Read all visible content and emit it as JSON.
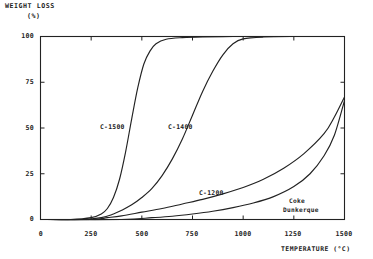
{
  "figure": {
    "background": "#ffffff",
    "ink": "#222222"
  },
  "axes": {
    "y_title_line1": "WEIGHT LOSS",
    "y_title_line2": "(%)",
    "x_title": "TEMPERATURE (°C)"
  },
  "chart_data": {
    "type": "line",
    "title": "",
    "subtitle": "",
    "xlabel": "TEMPERATURE (°C)",
    "ylabel": "WEIGHT LOSS (%)",
    "xlim": [
      0,
      1500
    ],
    "ylim": [
      0,
      100
    ],
    "xticks": [
      0,
      250,
      500,
      750,
      1000,
      1250,
      1500
    ],
    "yticks": [
      0,
      25,
      50,
      75,
      100
    ],
    "xtick_labels": [
      "0",
      "250",
      "500",
      "750",
      "1000",
      "1250",
      "1500"
    ],
    "ytick_labels": [
      "0",
      "25",
      "50",
      "75",
      "100"
    ],
    "grid": false,
    "legend": "inline-annotations",
    "line_color": "#222222",
    "series": [
      {
        "name": "C-1500",
        "label": "C-1500",
        "label_x": 420,
        "label_y": 53,
        "x": [
          0,
          150,
          250,
          300,
          330,
          360,
          390,
          420,
          450,
          480,
          510,
          540,
          570,
          620,
          700,
          800,
          950,
          1100,
          1250,
          1400,
          1500
        ],
        "y": [
          0,
          0,
          1,
          3,
          6,
          12,
          22,
          37,
          55,
          72,
          85,
          92,
          96,
          98.5,
          99.4,
          99.8,
          100,
          100,
          100,
          100,
          100
        ]
      },
      {
        "name": "C-1400",
        "label": "C-1400",
        "label_x": 700,
        "label_y": 53,
        "x": [
          0,
          200,
          300,
          360,
          400,
          450,
          500,
          550,
          600,
          650,
          700,
          750,
          800,
          850,
          900,
          950,
          1000,
          1100,
          1250,
          1400,
          1500
        ],
        "y": [
          0,
          0,
          1,
          3,
          5,
          8,
          12,
          17,
          24,
          33,
          44,
          57,
          70,
          81,
          90,
          96,
          98.7,
          99.7,
          100,
          100,
          100
        ]
      },
      {
        "name": "C-1200",
        "label": "C-1200",
        "label_x": 800,
        "label_y": 17,
        "x": [
          0,
          250,
          330,
          400,
          500,
          600,
          700,
          800,
          900,
          1000,
          1100,
          1200,
          1300,
          1400,
          1450,
          1500
        ],
        "y": [
          0,
          0,
          1,
          2,
          4,
          6,
          8.5,
          11,
          14,
          17.5,
          22,
          28,
          36,
          47,
          56,
          67
        ]
      },
      {
        "name": "Coke Dunkerque",
        "label_line1": "Coke",
        "label_line2": "Dunkerque",
        "label_x": 1230,
        "label_y": 11,
        "x": [
          0,
          400,
          550,
          650,
          750,
          850,
          950,
          1050,
          1150,
          1250,
          1330,
          1400,
          1450,
          1500
        ],
        "y": [
          0,
          0,
          1,
          1.8,
          3,
          4.5,
          6.5,
          9,
          12.5,
          18,
          25,
          35,
          46,
          65
        ]
      }
    ]
  }
}
